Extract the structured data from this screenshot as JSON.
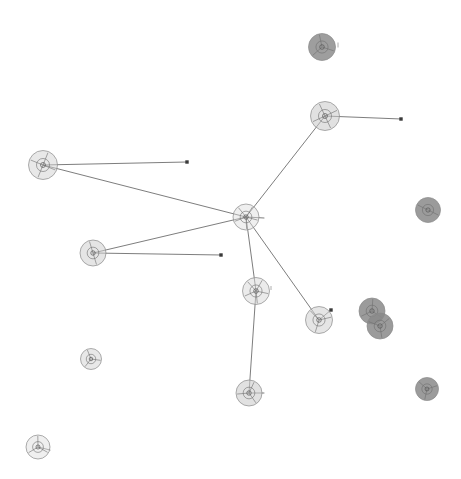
{
  "figure": {
    "title": "",
    "background_color": "#ffffff",
    "width": 461,
    "height": 479,
    "node_stroke_color": "#8a8a8a",
    "edge_color": "#5c5c5c",
    "endpoint_color": "#3a3a3a"
  },
  "chart_data": {
    "type": "scatter",
    "title": "",
    "subtitle": "",
    "xlabel": "",
    "ylabel": "",
    "grid": false,
    "legend": "none",
    "xlim": [
      0,
      461
    ],
    "ylim": [
      0,
      479
    ],
    "nodes": [
      {
        "id": "n1",
        "label": "",
        "x": 322,
        "y": 47,
        "r": 13.5,
        "fill": "#8d8d8d",
        "opacity": 0.85,
        "spokes": 3,
        "rings": 1
      },
      {
        "id": "n2",
        "label": "",
        "x": 325,
        "y": 116,
        "r": 14.5,
        "fill": "#c9c9c9",
        "opacity": 0.55,
        "spokes": 4,
        "rings": 1
      },
      {
        "id": "n3",
        "label": "",
        "x": 43,
        "y": 165,
        "r": 14.5,
        "fill": "#d2d2d2",
        "opacity": 0.5,
        "spokes": 4,
        "rings": 1
      },
      {
        "id": "n4",
        "label": "",
        "x": 246,
        "y": 217,
        "r": 13.0,
        "fill": "#dcdcdc",
        "opacity": 0.45,
        "spokes": 5,
        "rings": 1
      },
      {
        "id": "n5",
        "label": "",
        "x": 428,
        "y": 210,
        "r": 12.5,
        "fill": "#8a8a8a",
        "opacity": 0.85,
        "spokes": 2,
        "rings": 1
      },
      {
        "id": "n6",
        "label": "",
        "x": 93,
        "y": 253,
        "r": 13.0,
        "fill": "#cfcfcf",
        "opacity": 0.55,
        "spokes": 2,
        "rings": 1
      },
      {
        "id": "n7",
        "label": "",
        "x": 256,
        "y": 291,
        "r": 13.5,
        "fill": "#d8d8d8",
        "opacity": 0.5,
        "spokes": 5,
        "rings": 1
      },
      {
        "id": "n8",
        "label": "",
        "x": 319,
        "y": 320,
        "r": 13.5,
        "fill": "#d0d0d0",
        "opacity": 0.55,
        "spokes": 3,
        "rings": 1
      },
      {
        "id": "n9",
        "label": "",
        "x": 372,
        "y": 311,
        "r": 13.0,
        "fill": "#8a8a8a",
        "opacity": 0.85,
        "spokes": 3,
        "rings": 1
      },
      {
        "id": "n10",
        "label": "",
        "x": 380,
        "y": 326,
        "r": 13.0,
        "fill": "#8a8a8a",
        "opacity": 0.85,
        "spokes": 3,
        "rings": 1
      },
      {
        "id": "n11",
        "label": "",
        "x": 91,
        "y": 359,
        "r": 10.5,
        "fill": "#d5d5d5",
        "opacity": 0.55,
        "spokes": 3,
        "rings": 1
      },
      {
        "id": "n12",
        "label": "",
        "x": 249,
        "y": 393,
        "r": 13.0,
        "fill": "#cdcdcd",
        "opacity": 0.6,
        "spokes": 3,
        "rings": 1
      },
      {
        "id": "n13",
        "label": "",
        "x": 427,
        "y": 389,
        "r": 11.5,
        "fill": "#8a8a8a",
        "opacity": 0.85,
        "spokes": 3,
        "rings": 1
      },
      {
        "id": "n14",
        "label": "",
        "x": 38,
        "y": 447,
        "r": 12.0,
        "fill": "#e0e0e0",
        "opacity": 0.5,
        "spokes": 3,
        "rings": 1
      }
    ],
    "edges": [
      {
        "source": "n4",
        "target": "n2",
        "x1": 246,
        "y1": 217,
        "x2": 325,
        "y2": 116
      },
      {
        "source": "n4",
        "target": "n3",
        "x1": 246,
        "y1": 217,
        "x2": 43,
        "y2": 165
      },
      {
        "source": "n4",
        "target": "n6",
        "x1": 246,
        "y1": 217,
        "x2": 93,
        "y2": 253
      },
      {
        "source": "n4",
        "target": "n7",
        "x1": 246,
        "y1": 217,
        "x2": 256,
        "y2": 291
      },
      {
        "source": "n4",
        "target": "n8",
        "x1": 246,
        "y1": 217,
        "x2": 319,
        "y2": 320
      },
      {
        "source": "n7",
        "target": "n12",
        "x1": 256,
        "y1": 291,
        "x2": 249,
        "y2": 393
      }
    ],
    "stub_edges": [
      {
        "from": "n2",
        "x1": 325,
        "y1": 116,
        "x2": 401,
        "y2": 119,
        "endpoint": true
      },
      {
        "from": "n3",
        "x1": 43,
        "y1": 165,
        "x2": 187,
        "y2": 162,
        "endpoint": true
      },
      {
        "from": "n6",
        "x1": 93,
        "y1": 253,
        "x2": 221,
        "y2": 255,
        "endpoint": true
      },
      {
        "from": "n4",
        "x1": 246,
        "y1": 217,
        "x2": 264,
        "y2": 218,
        "endpoint": false
      },
      {
        "from": "n8",
        "x1": 319,
        "y1": 320,
        "x2": 331,
        "y2": 310,
        "endpoint": true
      },
      {
        "from": "n12",
        "x1": 249,
        "y1": 393,
        "x2": 264,
        "y2": 393,
        "endpoint": false
      },
      {
        "from": "n14",
        "x1": 38,
        "y1": 447,
        "x2": 50,
        "y2": 450,
        "endpoint": false
      }
    ],
    "tick_marks": [
      {
        "x": 338,
        "y": 45,
        "length": 5
      },
      {
        "x": 271,
        "y": 288,
        "length": 4
      }
    ]
  }
}
